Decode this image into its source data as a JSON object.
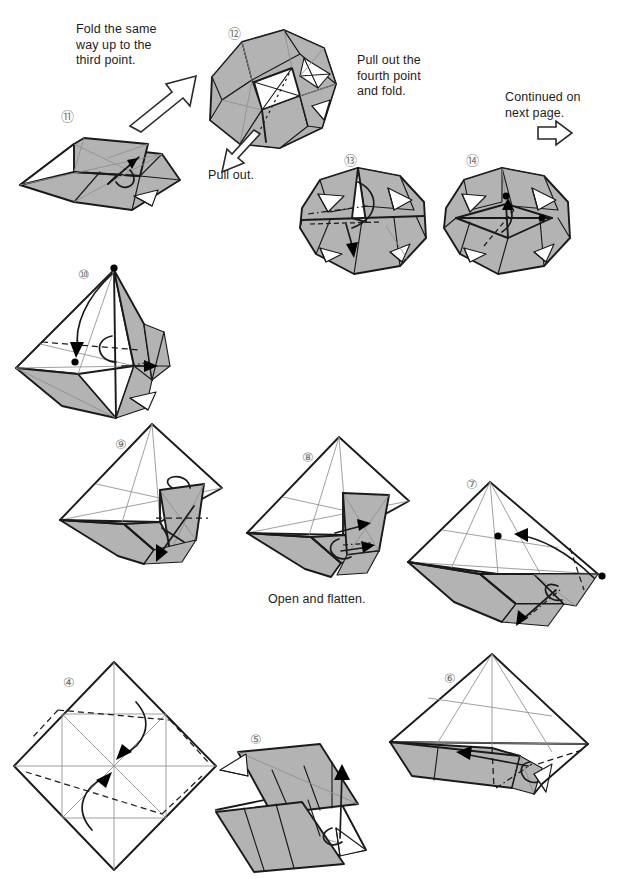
{
  "document": {
    "type": "origami-instruction-diagram",
    "page_background": "#ffffff",
    "ink_color": "#1a1a1a",
    "paper_fill_gray": "#b3b3b3",
    "paper_fill_white": "#ffffff",
    "step_number_color": "#707070"
  },
  "captions": [
    {
      "id": "fold-third-point",
      "text": "Fold the same\nway up to the\nthird point."
    },
    {
      "id": "pull-out",
      "text": "Pull out."
    },
    {
      "id": "pull-out-fourth",
      "text": "Pull out the\nfourth point\nand fold."
    },
    {
      "id": "continued",
      "text": "Continued on\nnext page."
    },
    {
      "id": "open-flatten",
      "text": "Open and flatten."
    }
  ],
  "steps": [
    {
      "number": "④",
      "label": "4",
      "name": "step-4",
      "description": "Flat square rotated 45 degrees with valley fold creases and two curved fold arrows"
    },
    {
      "number": "⑤",
      "label": "5",
      "name": "step-5",
      "description": "Flattened parallelogram with gray upper flap and fold-up arrow"
    },
    {
      "number": "⑥",
      "label": "6",
      "name": "step-6",
      "description": "Kite form with gray band, valley fold dashes and leftward fold arrow"
    },
    {
      "number": "⑦",
      "label": "7",
      "name": "step-7",
      "description": "Diamond with two reference dots, curved arrows and mountain creases"
    },
    {
      "number": "⑧",
      "label": "8",
      "name": "step-8",
      "description": "Three dimensional kite, open and flatten the pocket"
    },
    {
      "number": "⑨",
      "label": "9",
      "name": "step-9",
      "description": "Three dimensional kite with raised gray flap and downward fold arrow"
    },
    {
      "number": "⑩",
      "label": "10",
      "name": "step-10",
      "description": "Three dimensional form with two reference dots and matching arrow"
    },
    {
      "number": "⑪",
      "label": "11",
      "name": "step-11",
      "description": "Elongated three dimensional form with pull out arrow"
    },
    {
      "number": "⑫",
      "label": "12",
      "name": "step-12",
      "description": "Rounded polygonal form with dotted mountain fold and pull out arrow"
    },
    {
      "number": "⑬",
      "label": "13",
      "name": "step-13",
      "description": "Octagonal form with valley fold and downward fold arrow"
    },
    {
      "number": "⑭",
      "label": "14",
      "name": "step-14",
      "description": "Octagonal form with two reference dots and matching arrow"
    }
  ],
  "symbols": [
    {
      "id": "open-arrow-up-right",
      "name": "hollow-arrow-icon",
      "direction": "up-right"
    },
    {
      "id": "open-arrow-down-left",
      "name": "hollow-arrow-icon",
      "direction": "down-left"
    },
    {
      "id": "open-arrow-right",
      "name": "hollow-arrow-icon",
      "direction": "right"
    }
  ]
}
